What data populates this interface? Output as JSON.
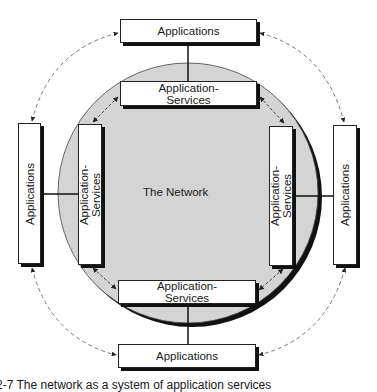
{
  "diagram": {
    "center_label": "The Network",
    "colors": {
      "network_fill": "#d4d4d4",
      "shadow": "#111111",
      "line": "#222222"
    },
    "boxes": {
      "top_app": "Applications",
      "top_svc_1": "Application-",
      "top_svc_2": "Services",
      "left_app": "Applications",
      "left_svc_1": "Application-",
      "left_svc_2": "Services",
      "right_app": "Applications",
      "right_svc_1": "Application-",
      "right_svc_2": "Services",
      "bottom_svc_1": "Application-",
      "bottom_svc_2": "Services",
      "bottom_app": "Applications"
    },
    "caption": "2-7 The network as a system of application services"
  }
}
